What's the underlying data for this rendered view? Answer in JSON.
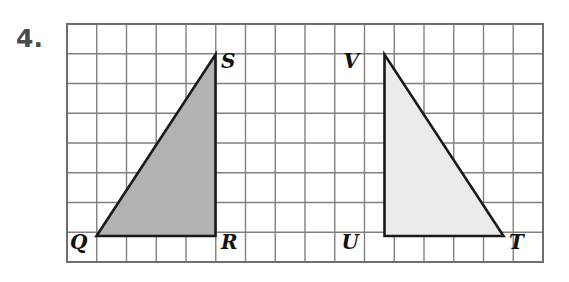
{
  "problem": {
    "number_label": "4."
  },
  "grid": {
    "origin_x": 67,
    "origin_y": 24,
    "cell_size": 29.75,
    "cols": 16,
    "rows": 8,
    "line_color": "#808080",
    "border_color": "#6e6e6e",
    "background": "#ffffff"
  },
  "figures": [
    {
      "name": "triangle-qrs",
      "fill": "#b2b2b2",
      "stroke": "#1a1a1a",
      "vertices": [
        {
          "label": "Q",
          "x": 96.5,
          "y": 236.0,
          "label_x": 70,
          "label_y": 249,
          "anchor": "start"
        },
        {
          "label": "R",
          "x": 215.5,
          "y": 236.0,
          "label_x": 221,
          "label_y": 249,
          "anchor": "start"
        },
        {
          "label": "S",
          "x": 215.5,
          "y": 54.5,
          "label_x": 221,
          "label_y": 68,
          "anchor": "start"
        }
      ],
      "side_lengths": {
        "base": 4,
        "height": 6
      }
    },
    {
      "name": "triangle-uvt",
      "fill": "#ebebeb",
      "stroke": "#1a1a1a",
      "vertices": [
        {
          "label": "V",
          "x": 384.5,
          "y": 54.5,
          "label_x": 359,
          "label_y": 68,
          "anchor": "end"
        },
        {
          "label": "U",
          "x": 384.5,
          "y": 236.0,
          "label_x": 359,
          "label_y": 249,
          "anchor": "end"
        },
        {
          "label": "T",
          "x": 503.5,
          "y": 236.0,
          "label_x": 509,
          "label_y": 249,
          "anchor": "start"
        }
      ],
      "side_lengths": {
        "base": 4,
        "height": 6
      }
    }
  ]
}
